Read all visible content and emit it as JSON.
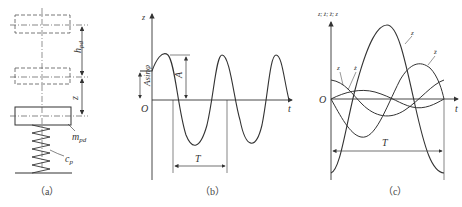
{
  "figure": {
    "panels": [
      {
        "id": "a",
        "caption": "（a）",
        "labels": {
          "h": "h",
          "h_sub": "pd",
          "z": "z",
          "m": "m",
          "m_sub": "pd",
          "c": "c",
          "c_sub": "p"
        },
        "description": "Spring-mass system: mass m_pd on spring c_p, displaced positions shown dashed, lift h_pd and displacement z"
      },
      {
        "id": "b",
        "caption": "（b）",
        "labels": {
          "y_axis": "z",
          "x_axis": "t",
          "origin": "O",
          "amplitude": "A",
          "initial": "Asinφ",
          "period": "T"
        },
        "description": "Sinusoidal displacement z(t) with amplitude A, initial offset Asinφ, period T"
      },
      {
        "id": "c",
        "caption": "（c）",
        "labels": {
          "y_axis": "z; ż; z̈; z⃛",
          "x_axis": "t",
          "origin": "O",
          "period": "T",
          "curve_1": "z",
          "curve_2": "ż",
          "curve_3": "z̈",
          "curve_4": "z⃛"
        },
        "description": "Displacement, velocity, acceleration and jerk curves over one period T"
      }
    ]
  }
}
